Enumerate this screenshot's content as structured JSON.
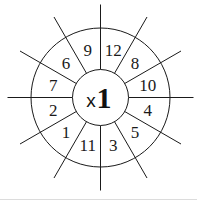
{
  "worksheet": {
    "title": "Multiplication wheel",
    "center": {
      "operator": "x",
      "multiplier": "1"
    },
    "segments_clockwise_from_top": [
      "12",
      "8",
      "10",
      "4",
      "5",
      "3",
      "11",
      "1",
      "2",
      "7",
      "6",
      "9"
    ],
    "colors": {
      "ink": "#1a1a1a",
      "background": "#ffffff",
      "rule": "#dcdcdc"
    }
  }
}
